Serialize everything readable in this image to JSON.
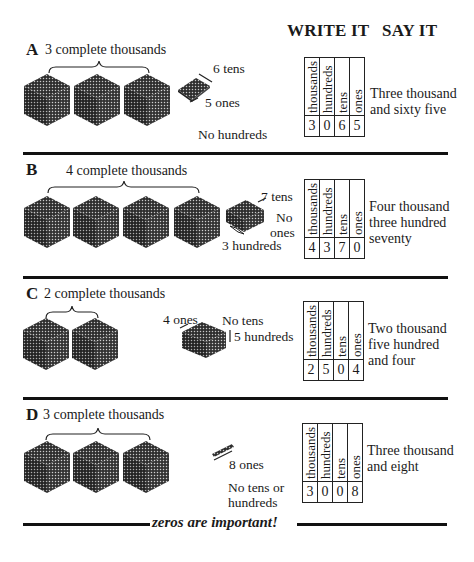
{
  "header": {
    "write_it": "WRITE IT",
    "say_it": "SAY IT"
  },
  "table_headers": [
    "thousands",
    "hundreds",
    "tens",
    "ones"
  ],
  "sections": [
    {
      "letter": "A",
      "title": "3 complete thousands",
      "labels": {
        "tens": "6 tens",
        "ones": "5 ones",
        "hundreds": "No hundreds"
      },
      "digits": [
        "3",
        "0",
        "6",
        "5"
      ],
      "say": [
        "Three thousand",
        "and sixty five"
      ]
    },
    {
      "letter": "B",
      "title": "4 complete thousands",
      "labels": {
        "tens": "7 tens",
        "ones_1": "No",
        "ones_2": "ones",
        "hundreds": "3 hundreds"
      },
      "digits": [
        "4",
        "3",
        "7",
        "0"
      ],
      "say": [
        "Four thousand",
        "three hundred",
        "seventy"
      ]
    },
    {
      "letter": "C",
      "title": "2 complete thousands",
      "labels": {
        "ones": "4 ones",
        "tens": "No tens",
        "hundreds": "5 hundreds"
      },
      "digits": [
        "2",
        "5",
        "0",
        "4"
      ],
      "say": [
        "Two thousand",
        "five hundred",
        "and four"
      ]
    },
    {
      "letter": "D",
      "title": "3 complete thousands",
      "labels": {
        "ones": "8 ones",
        "none_1": "No tens or",
        "none_2": "hundreds"
      },
      "digits": [
        "3",
        "0",
        "0",
        "8"
      ],
      "say": [
        "Three thousand",
        "and eight"
      ]
    }
  ],
  "footer": {
    "note": "zeros are important!"
  },
  "colors": {
    "ink": "#1a1a1a",
    "block_fill": "#3a3a3a",
    "background": "#ffffff"
  }
}
